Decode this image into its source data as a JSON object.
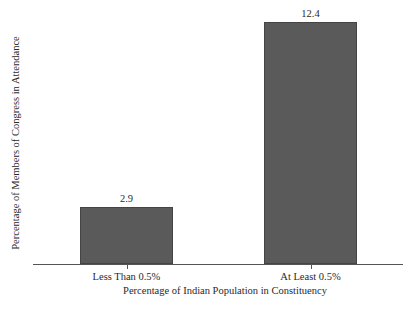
{
  "chart_data": {
    "type": "bar",
    "title": "",
    "categories": [
      "Less Than 0.5%",
      "At Least 0.5%"
    ],
    "values": [
      2.9,
      12.4
    ],
    "value_labels": [
      "2.9",
      "12.4"
    ],
    "xlabel": "Percentage of Indian Population in Constituency",
    "ylabel": "Percentage of Members of Congress in Attendance",
    "ylim": [
      0,
      12.4
    ],
    "grid": false,
    "legend": null,
    "bar_color": "#5a5a5a",
    "y_ticks_shown": false
  }
}
